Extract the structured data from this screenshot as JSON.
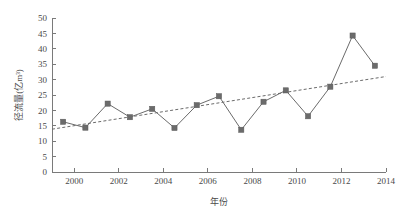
{
  "chart_data": {
    "type": "line",
    "title": "",
    "subtitle": "",
    "xlabel": "年份",
    "ylabel": "径流量(亿m³)",
    "xlim": [
      1999,
      2014
    ],
    "ylim": [
      0,
      50
    ],
    "grid": false,
    "legend": "none",
    "x": [
      1999.5,
      2000.5,
      2001.5,
      2002.5,
      2003.5,
      2004.5,
      2005.5,
      2006.5,
      2007.5,
      2008.5,
      2009.5,
      2010.5,
      2011.5,
      2012.5,
      2013.5
    ],
    "values": [
      16.3,
      14.4,
      22.2,
      17.8,
      20.5,
      14.3,
      21.7,
      24.6,
      13.7,
      22.8,
      26.5,
      18.1,
      27.7,
      44.3,
      34.5
    ],
    "series": [
      {
        "name": "径流量",
        "values": [
          16.3,
          14.4,
          22.2,
          17.8,
          20.5,
          14.3,
          21.7,
          24.6,
          13.7,
          22.8,
          26.5,
          18.1,
          27.7,
          44.3,
          34.5
        ],
        "marker": "square",
        "color": "#6b6b6b",
        "style": "solid"
      },
      {
        "name": "线性趋势线",
        "x": [
          1999.0,
          2014.0
        ],
        "values": [
          13.9,
          31.0
        ],
        "color": "#6b6b6b",
        "style": "dashed"
      }
    ],
    "xticks": [
      2000,
      2002,
      2004,
      2006,
      2008,
      2010,
      2012,
      2014
    ],
    "xticklabels": [
      "2000",
      "2002",
      "2004",
      "2006",
      "2008",
      "2010",
      "2012",
      "2014"
    ],
    "yticks": [
      0,
      5,
      10,
      15,
      20,
      25,
      30,
      35,
      40,
      45,
      50
    ],
    "yticklabels": [
      "0",
      "5",
      "10",
      "15",
      "20",
      "25",
      "30",
      "35",
      "40",
      "45",
      "50"
    ],
    "annotations": [],
    "colors": {
      "marker": "#6b6b6b",
      "line": "#6b6b6b",
      "trend": "#6b6b6b",
      "axis": "#7a7a7a",
      "text": "#4a4a4a",
      "background": "#ffffff"
    }
  }
}
